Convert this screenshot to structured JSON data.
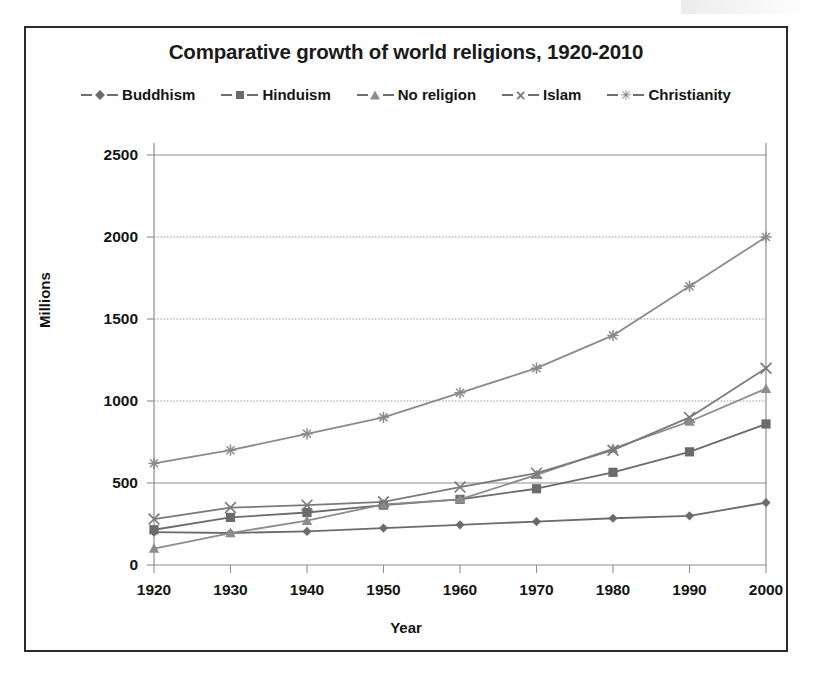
{
  "chart_data": {
    "type": "line",
    "title": "Comparative growth of world religions, 1920-2010",
    "xlabel": "Year",
    "ylabel": "Millions",
    "categories": [
      1920,
      1930,
      1940,
      1950,
      1960,
      1970,
      1980,
      1990,
      2000
    ],
    "xtick_labels": [
      "1920",
      "1930",
      "1940",
      "1950",
      "1960",
      "1970",
      "1980",
      "1990",
      "2000"
    ],
    "ytick_labels": [
      "0",
      "500",
      "1000",
      "1500",
      "2000",
      "2500"
    ],
    "yticks": [
      0,
      500,
      1000,
      1500,
      2000,
      2500
    ],
    "ylim": [
      0,
      2500
    ],
    "xlim": [
      1920,
      2000
    ],
    "grid": "horizontal-dotted",
    "legend_position": "top-center",
    "series": [
      {
        "name": "Buddhism",
        "marker": "diamond",
        "color": "#6b6b6b",
        "values": [
          200,
          195,
          205,
          225,
          245,
          265,
          285,
          300,
          380
        ]
      },
      {
        "name": "Hinduism",
        "marker": "square",
        "color": "#6b6b6b",
        "values": [
          215,
          290,
          320,
          365,
          400,
          465,
          565,
          690,
          860
        ]
      },
      {
        "name": "No religion",
        "marker": "triangle",
        "color": "#8c8c8c",
        "values": [
          100,
          195,
          270,
          370,
          400,
          550,
          710,
          875,
          1075
        ]
      },
      {
        "name": "Islam",
        "marker": "x",
        "color": "#7a7a7a",
        "values": [
          280,
          350,
          365,
          385,
          475,
          560,
          700,
          900,
          1200
        ]
      },
      {
        "name": "Christianity",
        "marker": "star",
        "color": "#8a8a8a",
        "values": [
          620,
          700,
          800,
          900,
          1050,
          1200,
          1400,
          1700,
          2000
        ]
      }
    ]
  },
  "legend": {
    "items": [
      {
        "label": "Buddhism",
        "icon": "diamond-marker-icon"
      },
      {
        "label": "Hinduism",
        "icon": "square-marker-icon"
      },
      {
        "label": "No religion",
        "icon": "triangle-marker-icon"
      },
      {
        "label": "Islam",
        "icon": "x-marker-icon"
      },
      {
        "label": "Christianity",
        "icon": "star-marker-icon"
      }
    ]
  }
}
